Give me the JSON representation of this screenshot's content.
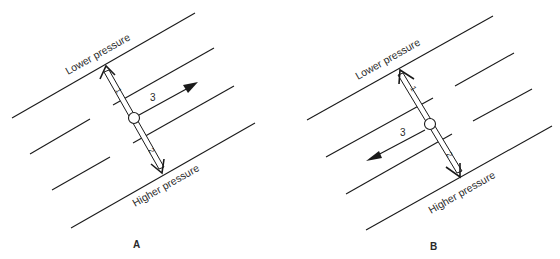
{
  "figure": {
    "panels": [
      {
        "id": "A",
        "panel_label": "A",
        "lower_label": "Lower pressure",
        "higher_label": "Higher pressure",
        "arrow_labels": {
          "force_1": "1",
          "force_2": "2",
          "motion_3": "3"
        },
        "motion_direction": "right"
      },
      {
        "id": "B",
        "panel_label": "B",
        "lower_label": "Lower pressure",
        "higher_label": "Higher pressure",
        "arrow_labels": {
          "force_1": "1",
          "force_2": "2",
          "motion_3": "3"
        },
        "motion_direction": "left"
      }
    ],
    "colors": {
      "ink": "#1a1a1a",
      "background": "#ffffff"
    }
  }
}
